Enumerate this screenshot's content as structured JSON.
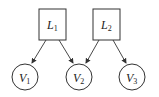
{
  "diagram": {
    "latent_nodes": [
      {
        "id": "L1",
        "base": "L",
        "sub": "1",
        "cx": 52,
        "cy": 24
      },
      {
        "id": "L2",
        "base": "L",
        "sub": "2",
        "cx": 106,
        "cy": 24
      }
    ],
    "observed_nodes": [
      {
        "id": "V1",
        "base": "V",
        "sub": "1",
        "cx": 25,
        "cy": 77
      },
      {
        "id": "V2",
        "base": "V",
        "sub": "2",
        "cx": 79,
        "cy": 77
      },
      {
        "id": "V3",
        "base": "V",
        "sub": "3",
        "cx": 132,
        "cy": 77
      }
    ],
    "edges": [
      {
        "from": "L1",
        "to": "V1"
      },
      {
        "from": "L1",
        "to": "V2"
      },
      {
        "from": "L2",
        "to": "V2"
      },
      {
        "from": "L2",
        "to": "V3"
      }
    ],
    "colors": {
      "stroke": "#333333",
      "background": "#ffffff"
    }
  }
}
